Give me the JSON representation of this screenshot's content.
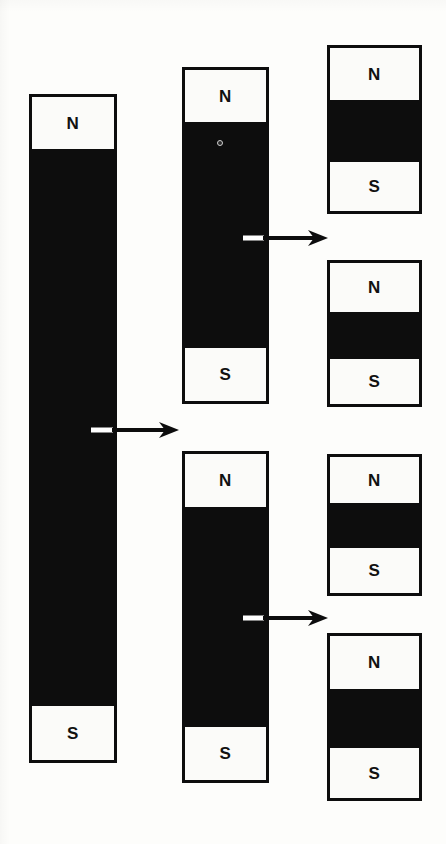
{
  "figure": {
    "background_color": "#fdfdfb",
    "ink_color": "#0d0d0d",
    "pole_face_color": "#fbfbf9"
  },
  "magnets": [
    {
      "id": "original-magnet",
      "stage": 1,
      "north_label": "N",
      "south_label": "S",
      "x": 29,
      "y": 94,
      "width": 88,
      "height": 669,
      "north_height": 52,
      "south_height": 54
    },
    {
      "id": "half-magnet-top",
      "stage": 2,
      "north_label": "N",
      "south_label": "S",
      "x": 182,
      "y": 67,
      "width": 87,
      "height": 337,
      "north_height": 52,
      "south_height": 53
    },
    {
      "id": "half-magnet-bottom",
      "stage": 2,
      "north_label": "N",
      "south_label": "S",
      "x": 182,
      "y": 451,
      "width": 87,
      "height": 332,
      "north_height": 53,
      "south_height": 53
    },
    {
      "id": "quarter-magnet-1",
      "stage": 3,
      "north_label": "N",
      "south_label": "S",
      "x": 327,
      "y": 45,
      "width": 95,
      "height": 169,
      "north_height": 52,
      "south_height": 49
    },
    {
      "id": "quarter-magnet-2",
      "stage": 3,
      "north_label": "N",
      "south_label": "S",
      "x": 327,
      "y": 260,
      "width": 95,
      "height": 147,
      "north_height": 49,
      "south_height": 45
    },
    {
      "id": "quarter-magnet-3",
      "stage": 3,
      "north_label": "N",
      "south_label": "S",
      "x": 327,
      "y": 454,
      "width": 95,
      "height": 142,
      "north_height": 46,
      "south_height": 45
    },
    {
      "id": "quarter-magnet-4",
      "stage": 3,
      "north_label": "N",
      "south_label": "S",
      "x": 327,
      "y": 633,
      "width": 95,
      "height": 168,
      "north_height": 53,
      "south_height": 50
    }
  ],
  "arrows": [
    {
      "id": "split-arrow-1",
      "from": "original-magnet",
      "to": "half-magnet-top",
      "x": 91,
      "y": 419,
      "length": 88,
      "break_dash_length": 22
    },
    {
      "id": "split-arrow-2",
      "from": "half-magnet-top",
      "to": "quarter-magnet-1",
      "x": 243,
      "y": 227,
      "length": 85,
      "break_dash_length": 21
    },
    {
      "id": "split-arrow-3",
      "from": "half-magnet-bottom",
      "to": "quarter-magnet-3",
      "x": 243,
      "y": 607,
      "length": 85,
      "break_dash_length": 21
    }
  ],
  "artifacts": [
    {
      "id": "scan-speck",
      "x": 217,
      "y": 140
    }
  ]
}
